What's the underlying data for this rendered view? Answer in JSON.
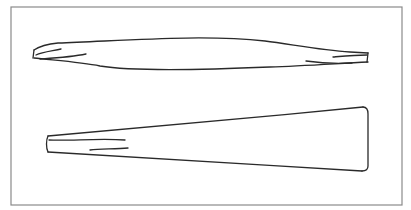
{
  "figure": {
    "colors": {
      "background": "#ffffff",
      "frame": "#8a8a8a",
      "ink": "#2a2a2a"
    },
    "frame": {
      "x": 11,
      "y": 7,
      "width": 391,
      "height": 198
    },
    "shapes": [
      {
        "name": "upper-double-ended-strip",
        "label": ""
      },
      {
        "name": "lower-wedge-strip",
        "label": ""
      }
    ]
  }
}
